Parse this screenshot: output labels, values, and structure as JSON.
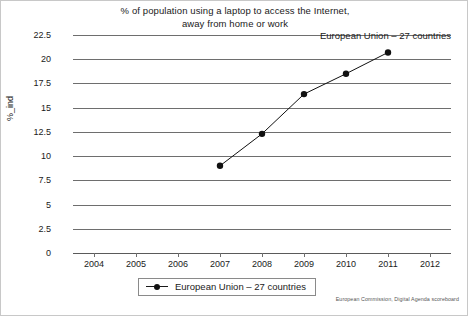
{
  "chart_data": {
    "type": "line",
    "title": "% of population using a laptop to access the Internet, away from home or work",
    "title_line1": "% of population using a laptop to access the Internet,",
    "title_line2": "away from home or work",
    "xlabel": "",
    "ylabel": "%_ind",
    "x": [
      2007,
      2008,
      2009,
      2010,
      2011
    ],
    "values": [
      9.0,
      12.3,
      16.4,
      18.5,
      20.7
    ],
    "series": [
      {
        "name": "European Union – 27 countries",
        "x": [
          2007,
          2008,
          2009,
          2010,
          2011
        ],
        "values": [
          9.0,
          12.3,
          16.4,
          18.5,
          20.7
        ],
        "color": "#111111",
        "marker": "circle"
      }
    ],
    "xlim": [
      2003.5,
      2012.5
    ],
    "ylim": [
      0,
      22.5
    ],
    "xticks": [
      2004,
      2005,
      2006,
      2007,
      2008,
      2009,
      2010,
      2011,
      2012
    ],
    "xtick_labels": [
      "2004",
      "2005",
      "2006",
      "2007",
      "2008",
      "2009",
      "2010",
      "2011",
      "2012"
    ],
    "yticks": [
      0,
      2.5,
      5,
      7.5,
      10,
      12.5,
      15,
      17.5,
      20,
      22.5
    ],
    "ytick_labels": [
      "0",
      "2.5",
      "5",
      "7.5",
      "10",
      "12.5",
      "15",
      "17.5",
      "20",
      "22.5"
    ],
    "grid": true,
    "grid_axis": "y",
    "legend_position": "bottom",
    "annotations": [
      {
        "text": "European Union – 27 countries",
        "anchor_x": 2011,
        "anchor_y": 20.7
      }
    ]
  },
  "legend": {
    "entries": [
      {
        "label": "European Union – 27 countries",
        "marker": "line-dot-marker"
      }
    ]
  },
  "source": {
    "text": "European Commission, Digital Agenda scoreboard"
  },
  "colors": {
    "series": "#111111",
    "grid": "#6e6e6e",
    "text": "#1a1a1a",
    "background": "#ffffff"
  }
}
